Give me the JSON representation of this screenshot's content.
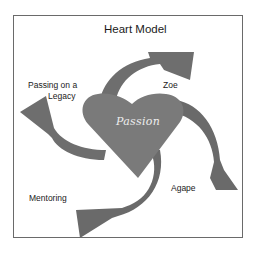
{
  "diagram": {
    "title": "Heart Model",
    "center_label": "Passion",
    "labels": {
      "top_right": "Zoe",
      "top_left_line1": "Passing on a",
      "top_left_line2": "Legacy",
      "bottom_right": "Agape",
      "bottom_left": "Mentoring"
    },
    "colors": {
      "heart_fill": "#7a7a7a",
      "arrow_fill": "#6e6e6e",
      "arrow_dark": "#5a5a5a",
      "frame_border": "#6a6a6a",
      "center_text": "#eeeeee"
    }
  }
}
